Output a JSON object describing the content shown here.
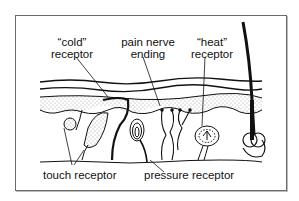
{
  "diagram": {
    "type": "skin cross-section with sensory receptors",
    "labels": {
      "cold_line1": "“cold”",
      "cold_line2": "receptor",
      "pain_line1": "pain nerve",
      "pain_line2": "ending",
      "heat_line1": "“heat”",
      "heat_line2": "receptor",
      "touch": "touch receptor",
      "pressure": "pressure receptor"
    },
    "structures": [
      "epidermis layers",
      "dermis (stippled)",
      "hair follicle",
      "cold receptor",
      "pain nerve endings",
      "heat receptor",
      "touch receptors",
      "pressure receptor (Pacinian corpuscle)"
    ]
  }
}
